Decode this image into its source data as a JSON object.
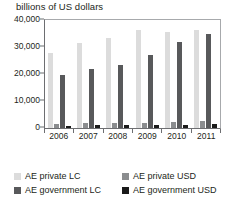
{
  "chart_data": {
    "type": "bar",
    "title": "billions of US dollars",
    "xlabel": "",
    "ylabel": "",
    "ylim": [
      0,
      40000
    ],
    "yticks": [
      "0",
      "10,000",
      "20,000",
      "30,000",
      "40,000"
    ],
    "ytick_values": [
      0,
      10000,
      20000,
      30000,
      40000
    ],
    "grid": false,
    "legend_position": "bottom",
    "categories": [
      "2006",
      "2007",
      "2008",
      "2009",
      "2010",
      "2011"
    ],
    "series": [
      {
        "name": "AE private LC",
        "color": "#dcdcdc",
        "values": [
          27600,
          31600,
          33200,
          36200,
          35500,
          36400
        ]
      },
      {
        "name": "AE private USD",
        "color": "#8b8d8f",
        "values": [
          1500,
          1700,
          1900,
          2000,
          2400,
          2600
        ]
      },
      {
        "name": "AE government LC",
        "color": "#58595b",
        "values": [
          19700,
          21900,
          23400,
          27000,
          32000,
          34700
        ]
      },
      {
        "name": "AE government USD",
        "color": "#1a1a1a",
        "values": [
          900,
          1000,
          1100,
          1200,
          1300,
          1500
        ]
      }
    ]
  }
}
